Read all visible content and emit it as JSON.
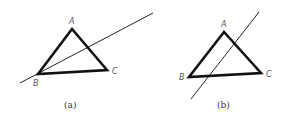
{
  "figures": [
    {
      "caption": "(a)",
      "vertices": {
        "A": "A",
        "B": "B",
        "C": "C"
      }
    },
    {
      "caption": "(b)",
      "vertices": {
        "A": "A",
        "B": "B",
        "C": "C"
      }
    }
  ],
  "colors": {
    "stroke": "#111111",
    "background": "#ffffff"
  }
}
